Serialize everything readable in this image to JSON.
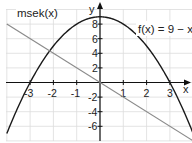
{
  "chart_data": {
    "type": "line",
    "title": "",
    "xlabel": "x",
    "ylabel": "y",
    "xlim": [
      -4,
      4
    ],
    "ylim": [
      -8,
      9.5
    ],
    "grid": true,
    "x_ticks": [
      -3,
      -2,
      -1,
      1,
      2,
      3
    ],
    "y_ticks": [
      -6,
      -4,
      -2,
      2,
      4,
      6,
      8
    ],
    "x_tick_labels": [
      "-3",
      "-2",
      "-1",
      "1",
      "2",
      "3"
    ],
    "y_tick_labels": [
      "-6",
      "-4",
      "-2",
      "2",
      "4",
      "6",
      "8"
    ],
    "series": [
      {
        "name": "f(x) = 9 − x²",
        "label_main": "f(x) = 9 − x",
        "label_sup": "2",
        "formula": "9 - x^2",
        "color": "#1a1a1a",
        "x": [
          -4,
          -3,
          -2,
          -1,
          0,
          1,
          2,
          3,
          4
        ],
        "values": [
          -7,
          0,
          5,
          8,
          9,
          8,
          5,
          0,
          -7
        ]
      },
      {
        "name": "msek(x)",
        "label_main": "msek(x)",
        "formula": "-2x",
        "color": "#8a8a8a",
        "x": [
          -4,
          -3,
          -2,
          -1,
          0,
          1,
          2,
          3,
          4
        ],
        "values": [
          8,
          6,
          4,
          2,
          0,
          -2,
          -4,
          -6,
          -8
        ]
      }
    ],
    "axis_labels": {
      "x": "x",
      "y": "y"
    }
  }
}
